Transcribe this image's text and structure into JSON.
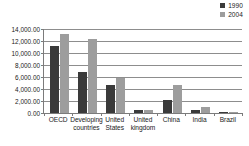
{
  "chart_data": {
    "type": "bar",
    "title": "",
    "subtitle": "",
    "xlabel": "",
    "ylabel": "",
    "categories": [
      "OECD",
      "Developing countries",
      "United States",
      "United kingdom",
      "China",
      "India",
      "Brazil"
    ],
    "series": [
      {
        "name": "1990",
        "color": "#3a3a3a",
        "values": [
          11100,
          6800,
          4650,
          550,
          2200,
          550,
          200
        ]
      },
      {
        "name": "2004",
        "color": "#9d9d9d",
        "values": [
          13250,
          12300,
          5800,
          450,
          4700,
          1050,
          250
        ]
      }
    ],
    "ylim": [
      0,
      14000
    ],
    "ytick_values": [
      0,
      2000,
      4000,
      6000,
      8000,
      10000,
      12000,
      14000
    ],
    "ytick_labels": [
      "0.00",
      "2,000.00",
      "4,000.00",
      "6,000.00",
      "8,000.00",
      "10,000.00",
      "12,000.00",
      "14,000.00"
    ],
    "grid": true,
    "legend_position": "top-right",
    "legend": [
      "1990",
      "2004"
    ]
  },
  "legend": {
    "entries": [
      {
        "label": "1990",
        "swatch": "legend-swatch-1990"
      },
      {
        "label": "2004",
        "swatch": "legend-swatch-2004"
      }
    ]
  },
  "colors": {
    "series_1990": "#3a3a3a",
    "series_2004": "#9d9d9d",
    "gridline": "#8d8d8d",
    "axis": "#7b7b7b",
    "background": "#ffffff",
    "text": "#1a1a1a"
  }
}
